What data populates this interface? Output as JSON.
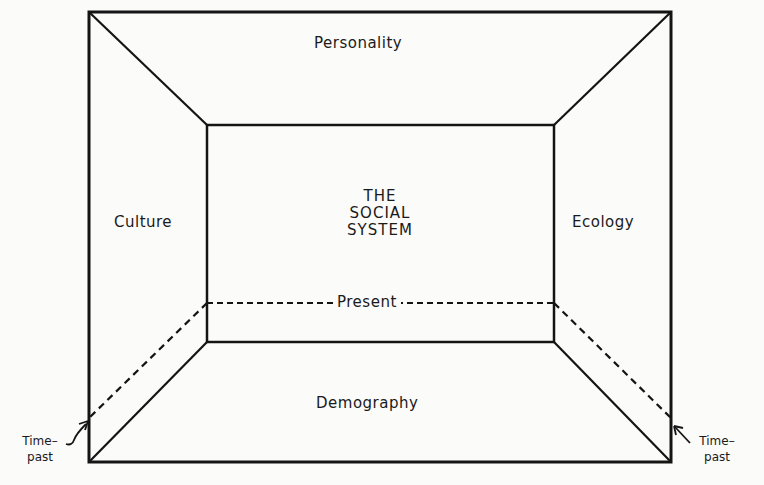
{
  "diagram": {
    "type": "perspective-room-diagram",
    "center": {
      "line1": "THE",
      "line2": "SOCIAL",
      "line3": "SYSTEM"
    },
    "top_label": "Personality",
    "left_label": "Culture",
    "right_label": "Ecology",
    "bottom_label": "Demography",
    "present_label": "Present",
    "time_past_left": {
      "line1": "Time–",
      "line2": "past"
    },
    "time_past_right": {
      "line1": "Time–",
      "line2": "past"
    },
    "colors": {
      "line": "#141414",
      "background": "#fbfbfa",
      "text": "#1a1a1a"
    }
  }
}
